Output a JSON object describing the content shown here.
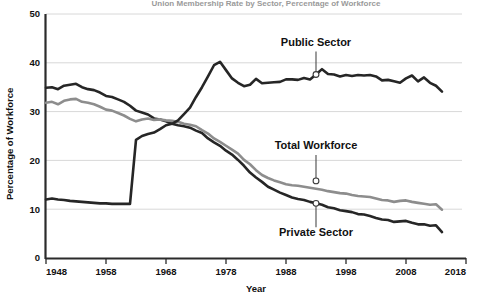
{
  "chart_data": {
    "type": "line",
    "title": "Union Membership Rate by Sector, Percentage of Workforce",
    "xlabel": "Year",
    "ylabel": "Percentage of Workforce",
    "xlim": [
      1948,
      2018
    ],
    "ylim": [
      0,
      50
    ],
    "xticks": [
      1948,
      1958,
      1968,
      1978,
      1988,
      1998,
      2008,
      2018
    ],
    "yticks": [
      0,
      10,
      20,
      30,
      40,
      50
    ],
    "grid": "horizontal",
    "legend_position": "inline-annotations",
    "colors": {
      "public_sector": "#262626",
      "private_sector": "#262626",
      "total_workforce": "#8d8d8d",
      "gridline": "#d8d8d8",
      "axis": "#2b2b2b"
    },
    "annotations": [
      {
        "text": "Public Sector",
        "series": "Public Sector",
        "point_year": 1993,
        "point_value": 37.6
      },
      {
        "text": "Total Workforce",
        "series": "Total Workforce",
        "point_year": 1993,
        "point_value": 15.8
      },
      {
        "text": "Private Sector",
        "series": "Private Sector",
        "point_year": 1993,
        "point_value": 11.2
      }
    ],
    "series": [
      {
        "name": "Private Sector",
        "color": "#262626",
        "x": [
          1948,
          1949,
          1950,
          1951,
          1952,
          1953,
          1954,
          1955,
          1956,
          1957,
          1958,
          1959,
          1960,
          1961,
          1962,
          1963,
          1964,
          1965,
          1966,
          1967,
          1968,
          1969,
          1970,
          1971,
          1972,
          1973,
          1974,
          1975,
          1976,
          1977,
          1978,
          1979,
          1980,
          1981,
          1982,
          1983,
          1984,
          1985,
          1986,
          1987,
          1988,
          1989,
          1990,
          1991,
          1992,
          1993,
          1994,
          1995,
          1996,
          1997,
          1998,
          1999,
          2000,
          2001,
          2002,
          2003,
          2004,
          2005,
          2006,
          2007,
          2008,
          2009,
          2010,
          2011,
          2012,
          2013,
          2014
        ],
        "values": [
          34.9,
          35.0,
          34.6,
          35.3,
          35.5,
          35.7,
          35.0,
          34.6,
          34.4,
          33.9,
          33.2,
          33.0,
          32.5,
          32.0,
          31.2,
          30.2,
          29.8,
          29.4,
          28.6,
          28.4,
          28.0,
          27.5,
          27.2,
          27.0,
          26.7,
          26.1,
          25.6,
          24.5,
          23.7,
          23.0,
          22.0,
          21.2,
          20.1,
          18.9,
          17.5,
          16.5,
          15.6,
          14.6,
          14.0,
          13.4,
          12.9,
          12.4,
          12.1,
          11.9,
          11.5,
          11.2,
          10.9,
          10.4,
          10.2,
          9.8,
          9.6,
          9.4,
          9.0,
          8.9,
          8.6,
          8.2,
          7.9,
          7.8,
          7.4,
          7.5,
          7.6,
          7.2,
          6.9,
          6.9,
          6.6,
          6.7,
          5.3
        ]
      },
      {
        "name": "Total Workforce",
        "color": "#8d8d8d",
        "x": [
          1948,
          1949,
          1950,
          1951,
          1952,
          1953,
          1954,
          1955,
          1956,
          1957,
          1958,
          1959,
          1960,
          1961,
          1962,
          1963,
          1964,
          1965,
          1966,
          1967,
          1968,
          1969,
          1970,
          1971,
          1972,
          1973,
          1974,
          1975,
          1976,
          1977,
          1978,
          1979,
          1980,
          1981,
          1982,
          1983,
          1984,
          1985,
          1986,
          1987,
          1988,
          1989,
          1990,
          1991,
          1992,
          1993,
          1994,
          1995,
          1996,
          1997,
          1998,
          1999,
          2000,
          2001,
          2002,
          2003,
          2004,
          2005,
          2006,
          2007,
          2008,
          2009,
          2010,
          2011,
          2012,
          2013,
          2014
        ],
        "values": [
          31.8,
          32.0,
          31.5,
          32.2,
          32.5,
          32.6,
          32.0,
          31.8,
          31.5,
          31.0,
          30.4,
          30.2,
          29.7,
          29.2,
          28.5,
          28.0,
          28.4,
          28.6,
          28.3,
          28.4,
          28.2,
          28.1,
          27.9,
          27.5,
          27.3,
          27.0,
          26.2,
          25.5,
          24.5,
          23.8,
          23.0,
          22.2,
          21.4,
          20.1,
          19.2,
          18.0,
          17.0,
          16.4,
          15.9,
          15.5,
          15.1,
          14.9,
          14.8,
          14.6,
          14.4,
          14.2,
          14.0,
          13.7,
          13.5,
          13.3,
          13.2,
          12.9,
          12.7,
          12.6,
          12.5,
          12.2,
          11.9,
          11.8,
          11.5,
          11.7,
          11.8,
          11.5,
          11.3,
          11.1,
          10.9,
          11.0,
          9.9
        ]
      },
      {
        "name": "Public Sector",
        "color": "#262626",
        "x": [
          1948,
          1949,
          1950,
          1951,
          1952,
          1953,
          1954,
          1955,
          1956,
          1957,
          1958,
          1959,
          1960,
          1961,
          1962,
          1963,
          1964,
          1965,
          1966,
          1967,
          1968,
          1969,
          1970,
          1971,
          1972,
          1973,
          1974,
          1975,
          1976,
          1977,
          1978,
          1979,
          1980,
          1981,
          1982,
          1983,
          1984,
          1985,
          1986,
          1987,
          1988,
          1989,
          1990,
          1991,
          1992,
          1993,
          1994,
          1995,
          1996,
          1997,
          1998,
          1999,
          2000,
          2001,
          2002,
          2003,
          2004,
          2005,
          2006,
          2007,
          2008,
          2009,
          2010,
          2011,
          2012,
          2013,
          2014
        ],
        "values": [
          12.0,
          12.2,
          12.0,
          11.9,
          11.7,
          11.6,
          11.5,
          11.4,
          11.3,
          11.2,
          11.2,
          11.1,
          11.1,
          11.1,
          11.1,
          24.2,
          25.0,
          25.4,
          25.7,
          26.4,
          27.2,
          27.5,
          28.2,
          29.5,
          30.8,
          33.0,
          35.0,
          37.2,
          39.5,
          40.2,
          38.5,
          36.8,
          35.9,
          35.2,
          35.5,
          36.7,
          35.8,
          35.9,
          36.0,
          36.1,
          36.6,
          36.6,
          36.5,
          36.9,
          36.6,
          37.6,
          38.7,
          37.7,
          37.6,
          37.2,
          37.5,
          37.3,
          37.5,
          37.4,
          37.5,
          37.2,
          36.4,
          36.5,
          36.2,
          35.9,
          36.8,
          37.4,
          36.2,
          37.0,
          35.9,
          35.3,
          34.1
        ]
      }
    ]
  }
}
